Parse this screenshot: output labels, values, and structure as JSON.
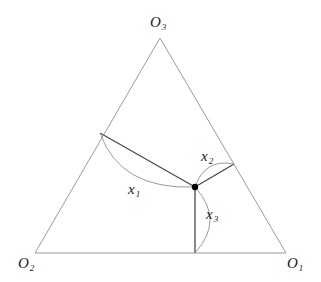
{
  "diagram": {
    "title": "",
    "vertices": [
      {
        "id": "O1",
        "label": "O",
        "sub": "1",
        "x": 286,
        "y": 253
      },
      {
        "id": "O2",
        "label": "O",
        "sub": "2",
        "x": 35,
        "y": 253
      },
      {
        "id": "O3",
        "label": "O",
        "sub": "3",
        "x": 160,
        "y": 38
      }
    ],
    "interior_point": {
      "x": 195,
      "y": 187
    },
    "feet": {
      "on_O2O3": {
        "x": 100,
        "y": 133
      },
      "on_O3O1": {
        "x": 234,
        "y": 164
      },
      "on_O1O2": {
        "x": 195,
        "y": 253
      }
    },
    "distances": [
      {
        "label": "x",
        "sub": "1"
      },
      {
        "label": "x",
        "sub": "2"
      },
      {
        "label": "x",
        "sub": "3"
      }
    ],
    "colors": {
      "edge": "#9a9a9a",
      "perpendicular": "#4a4a4a",
      "point": "#000000"
    }
  }
}
